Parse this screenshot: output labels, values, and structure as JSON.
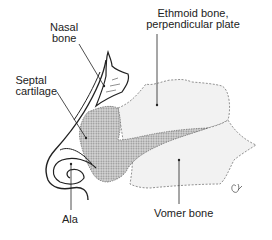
{
  "diagram": {
    "type": "anatomical-illustration",
    "labels": {
      "nasal_bone": [
        "Nasal",
        "bone"
      ],
      "ethmoid": [
        "Ethmoid bone,",
        "perpendicular plate"
      ],
      "septal_cartilage": [
        "Septal",
        "cartilage"
      ],
      "ala": "Ala",
      "vomer": "Vomer bone"
    },
    "signature": "C.R.",
    "colors": {
      "ink": "#222222",
      "cartilage_fill": "#bdbdbd",
      "bone_fill": "#f2f2f2",
      "dash_outline": "#777777"
    }
  }
}
